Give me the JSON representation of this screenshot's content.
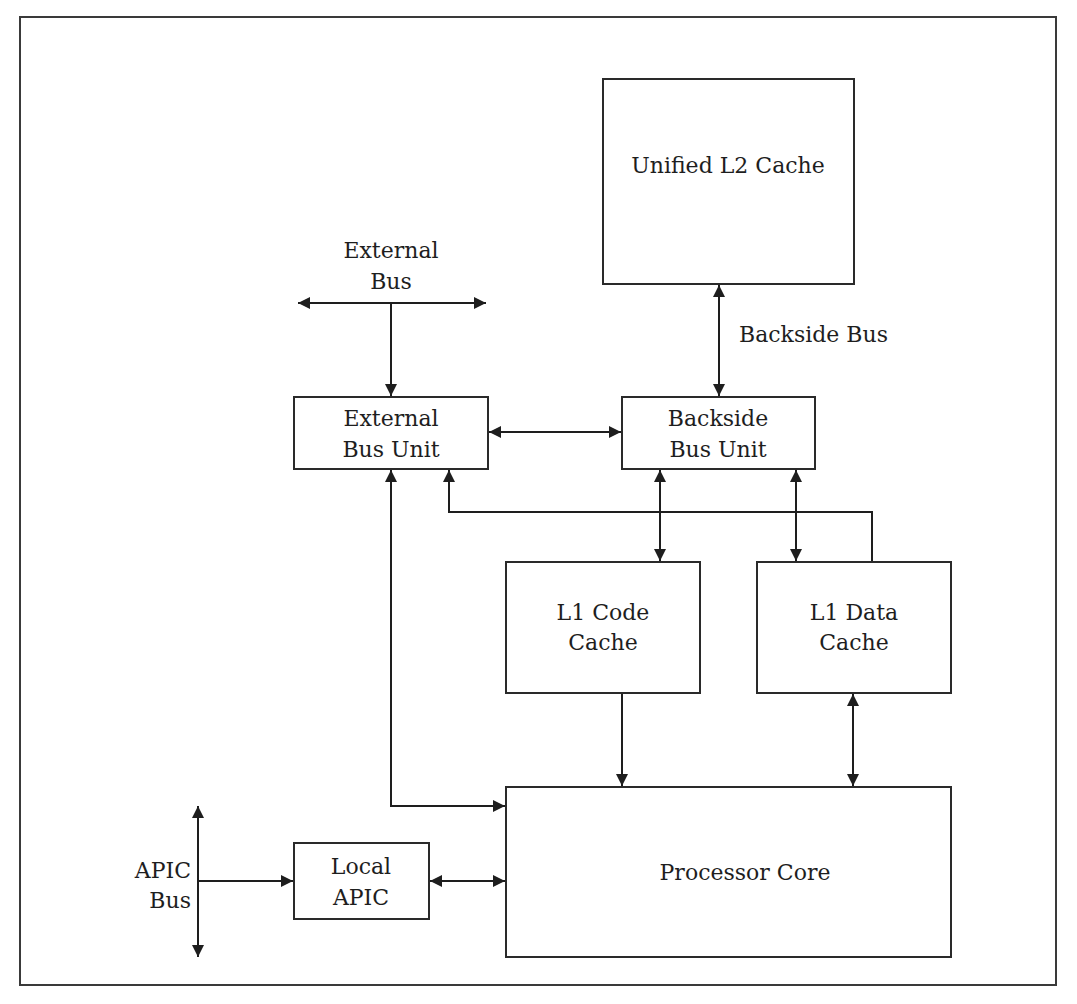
{
  "diagram": {
    "colors": {
      "stroke": "#1e1e1e",
      "background": "#ffffff"
    },
    "blocks": {
      "l2_cache": {
        "label": "Unified L2 Cache"
      },
      "external_bus_unit": {
        "line1": "External",
        "line2": "Bus Unit"
      },
      "backside_bus_unit": {
        "line1": "Backside",
        "line2": "Bus Unit"
      },
      "l1_code_cache": {
        "line1": "L1 Code",
        "line2": "Cache"
      },
      "l1_data_cache": {
        "line1": "L1 Data",
        "line2": "Cache"
      },
      "processor_core": {
        "label": "Processor Core"
      },
      "local_apic": {
        "line1": "Local",
        "line2": "APIC"
      }
    },
    "buses": {
      "external_bus": {
        "line1": "External",
        "line2": "Bus"
      },
      "backside_bus": {
        "label": "Backside Bus"
      },
      "apic_bus": {
        "line1": "APIC",
        "line2": "Bus"
      }
    },
    "connections": [
      {
        "from": "External Bus",
        "to": "External Bus Unit",
        "direction": "to"
      },
      {
        "from": "External Bus Unit",
        "to": "Backside Bus Unit",
        "direction": "both"
      },
      {
        "from": "Unified L2 Cache",
        "to": "Backside Bus Unit",
        "direction": "both"
      },
      {
        "from": "Backside Bus Unit",
        "to": "L1 Code Cache",
        "direction": "both"
      },
      {
        "from": "Backside Bus Unit",
        "to": "L1 Data Cache",
        "direction": "both"
      },
      {
        "from": "L1 Data Cache",
        "to": "External Bus Unit",
        "direction": "to"
      },
      {
        "from": "L1 Code Cache",
        "to": "Processor Core",
        "direction": "to"
      },
      {
        "from": "L1 Data Cache",
        "to": "Processor Core",
        "direction": "both"
      },
      {
        "from": "External Bus Unit",
        "to": "Processor Core",
        "direction": "both"
      },
      {
        "from": "APIC Bus",
        "to": "Local APIC",
        "direction": "to"
      },
      {
        "from": "Local APIC",
        "to": "Processor Core",
        "direction": "both"
      }
    ]
  }
}
